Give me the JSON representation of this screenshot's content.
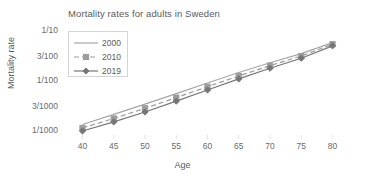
{
  "chart_data": {
    "type": "line",
    "title": "Mortality rates for adults in Sweden",
    "xlabel": "Age",
    "ylabel": "Mortality rate",
    "x": [
      40,
      45,
      50,
      55,
      60,
      65,
      70,
      75,
      80
    ],
    "categories": [
      "40",
      "45",
      "50",
      "55",
      "60",
      "65",
      "70",
      "75",
      "80"
    ],
    "xlim": [
      38,
      82
    ],
    "yscale": "log",
    "ylim": [
      0.001,
      0.1
    ],
    "ytick_values": [
      0.001,
      0.003,
      0.01,
      0.03,
      0.1
    ],
    "ytick_labels": [
      "1/1000",
      "3/1000",
      "1/100",
      "3/100",
      "1/10"
    ],
    "grid": false,
    "legend_position": "upper-left-inside",
    "series": [
      {
        "name": "2000",
        "color": "#a6a6a6",
        "style": "solid",
        "marker": "none",
        "values": [
          0.00135,
          0.00215,
          0.00345,
          0.0056,
          0.0091,
          0.0148,
          0.0232,
          0.0352,
          0.0585
        ]
      },
      {
        "name": "2010",
        "color": "#9c9c9c",
        "style": "dashed",
        "marker": "square",
        "values": [
          0.00115,
          0.00178,
          0.00285,
          0.00465,
          0.0077,
          0.0126,
          0.0203,
          0.0315,
          0.0545
        ]
      },
      {
        "name": "2019",
        "color": "#767676",
        "style": "solid",
        "marker": "diamond",
        "values": [
          0.001,
          0.00152,
          0.0024,
          0.00395,
          0.0066,
          0.011,
          0.018,
          0.0285,
          0.0505
        ]
      }
    ]
  }
}
